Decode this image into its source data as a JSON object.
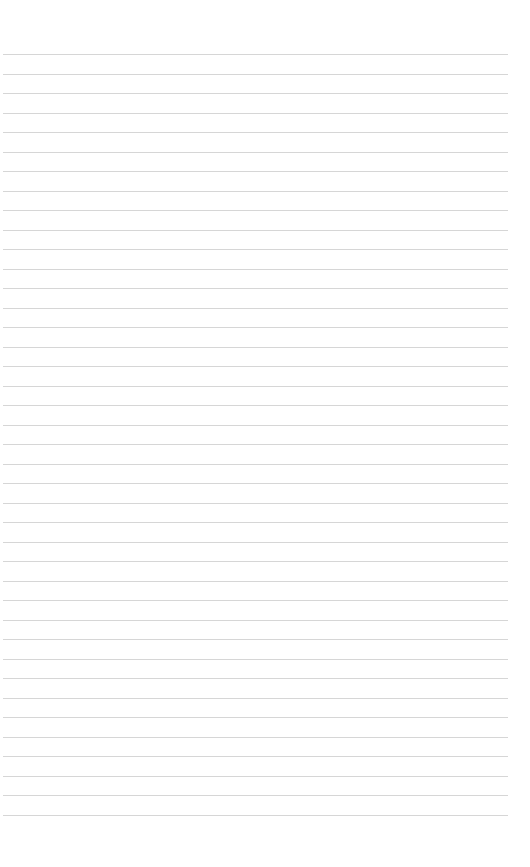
{
  "page": {
    "type": "blank-lined-paper",
    "background_color": "#ffffff",
    "rule_color": "#cfcfcf",
    "rule_count": 40,
    "first_rule_y": 54,
    "rule_spacing": 19.5,
    "rule_left": 3,
    "rule_right": 508,
    "text_content": []
  }
}
